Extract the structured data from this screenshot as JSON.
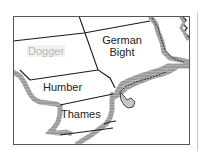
{
  "map": {
    "title": "",
    "colors": {
      "frame": "#555555",
      "boundary": "#1a1a1a",
      "land_shading": "#9a9a9a",
      "coastline": "#222222",
      "faded_label": "#b8b8b8"
    },
    "regions": [
      {
        "name": "Dogger",
        "highlighted": false,
        "faded": true
      },
      {
        "name": "German Bight",
        "line1": "German",
        "line2": "Bight"
      },
      {
        "name": "Humber"
      },
      {
        "name": "Thames"
      }
    ]
  }
}
